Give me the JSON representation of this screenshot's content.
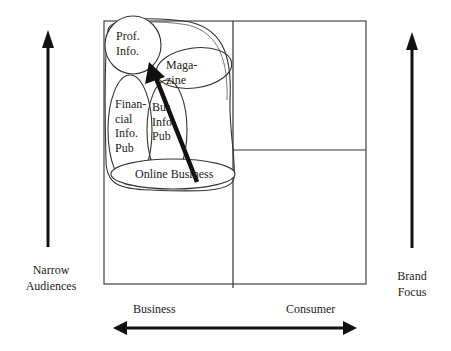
{
  "diagram": {
    "type": "positioning-matrix",
    "quadrant_labels": {
      "x_left": "Business",
      "x_right": "Consumer",
      "y_left_line1": "Narrow",
      "y_left_line2": "Audiences",
      "y_right_line1": "Brand",
      "y_right_line2": "Focus"
    },
    "segments": [
      {
        "id": "prof-info",
        "line1": "Prof.",
        "line2": "Info."
      },
      {
        "id": "magazine",
        "line1": "Maga-",
        "line2": "zine"
      },
      {
        "id": "financial-info-pub",
        "line1": "Finan-",
        "line2": "cial",
        "line3": "Info.",
        "line4": "Pub"
      },
      {
        "id": "bus-info-pub",
        "line1": "Bus",
        "line2": "Info",
        "line3": "Pub"
      },
      {
        "id": "online-business",
        "line1": "Online Business"
      }
    ],
    "colors": {
      "line": "#222222",
      "grid": "#444444",
      "background": "#ffffff"
    }
  }
}
